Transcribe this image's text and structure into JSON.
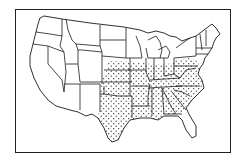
{
  "map": {
    "title": "",
    "region": "Contiguous United States",
    "style": "line-drawing with stippled shading",
    "colors": {
      "line": "#1a1a1a",
      "background": "#ffffff",
      "stipple": "#1a1a1a"
    },
    "shaded_states": [
      "NE",
      "KS",
      "OK",
      "TX",
      "IA",
      "MO",
      "AR",
      "LA",
      "IL",
      "IN",
      "OH",
      "KY",
      "TN",
      "MS",
      "AL",
      "GA",
      "PA",
      "WV",
      "VA",
      "MD",
      "DE",
      "NJ",
      "NC",
      "SC"
    ],
    "unshaded_states": [
      "WA",
      "OR",
      "CA",
      "ID",
      "NV",
      "MT",
      "WY",
      "UT",
      "AZ",
      "CO",
      "NM",
      "ND",
      "SD",
      "MN",
      "WI",
      "MI",
      "NY",
      "VT",
      "NH",
      "ME",
      "MA",
      "CT",
      "RI",
      "FL"
    ],
    "legend": []
  }
}
